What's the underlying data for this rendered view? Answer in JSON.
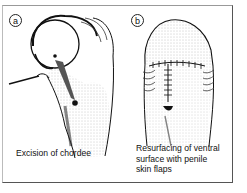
{
  "figure": {
    "panels": [
      {
        "label": "a",
        "caption": "Excision of chordee",
        "illustration": "curved shaft with glans, probe instrument inserted at left, excision site marked"
      },
      {
        "label": "b",
        "caption_lines": [
          "Resurfacing of ventral",
          "surface with penile",
          "skin flaps"
        ],
        "illustration": "straightened shaft with sutured ventral midline and circumferential suture line below glans"
      }
    ],
    "colors": {
      "ink": "#111111",
      "frame": "#555555",
      "background": "#ffffff"
    }
  }
}
